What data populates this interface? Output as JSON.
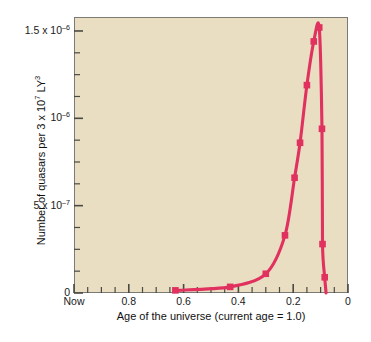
{
  "chart_data": {
    "type": "line",
    "title": "",
    "xlabel": "Age of the universe (current age = 1.0)",
    "ylabel": "Number of quasars per 3 x 10⁷ LY³",
    "xlim": [
      1.0,
      0.0
    ],
    "ylim": [
      0,
      1.58e-06
    ],
    "x_axis_reversed": true,
    "grid": false,
    "legend": null,
    "background_color": "#e9dec2",
    "line_color": "#e0315f",
    "marker": "square",
    "marker_color": "#e0315f",
    "x_ticklabels": [
      "Now",
      "0.8",
      "0.6",
      "0.4",
      "0.2",
      "0"
    ],
    "x_tickvalues": [
      1.0,
      0.8,
      0.6,
      0.4,
      0.2,
      0.0
    ],
    "x_minor_tick_step": 0.05,
    "y_ticklabels": [
      "0",
      "5 x 10⁻⁷",
      "10⁻⁶",
      "1.5 x 10⁻⁶"
    ],
    "y_tickvalues": [
      0,
      5e-07,
      1e-06,
      1.5e-06
    ],
    "y_minor_tick_step": 1.25e-07,
    "series": [
      {
        "name": "Number of quasars per 3 x 10^7 LY^3",
        "x": [
          0.63,
          0.43,
          0.3,
          0.23,
          0.195,
          0.175,
          0.15,
          0.125,
          0.105,
          0.095,
          0.093,
          0.085,
          0.08
        ],
        "y": [
          1.5e-08,
          3.5e-08,
          1.1e-07,
          3.3e-07,
          6.6e-07,
          8.6e-07,
          1.19e-06,
          1.44e-06,
          1.52e-06,
          9.4e-07,
          2.8e-07,
          9e-08,
          0.0
        ]
      }
    ],
    "annotations": []
  },
  "axis_titles": {
    "y": "Number of quasars per 3 x 10",
    "y_sup1": "7",
    "y_tail": " LY",
    "y_sup2": "3",
    "x": "Age of the universe (current age = 1.0)"
  },
  "y_ticks": [
    {
      "label_main": "0",
      "label_sup": "",
      "label_pre": "",
      "value": 0
    },
    {
      "label_main": "5 x 10",
      "label_sup": "–7",
      "label_pre": "",
      "value": 5e-07
    },
    {
      "label_main": "10",
      "label_sup": "–6",
      "label_pre": "",
      "value": 1e-06
    },
    {
      "label_main": "1.5 x 10",
      "label_sup": "–6",
      "label_pre": "",
      "value": 1.5e-06
    }
  ],
  "x_ticks": [
    {
      "label": "Now",
      "value": 1.0
    },
    {
      "label": "0.8",
      "value": 0.8
    },
    {
      "label": "0.6",
      "value": 0.6
    },
    {
      "label": "0.4",
      "value": 0.4
    },
    {
      "label": "0.2",
      "value": 0.2
    },
    {
      "label": "0",
      "value": 0.0
    }
  ],
  "bleed_text": {
    "line1": "FIGURE 26-18",
    "line2": "The Quasar as a Distant",
    "line3": "Light Force"
  }
}
